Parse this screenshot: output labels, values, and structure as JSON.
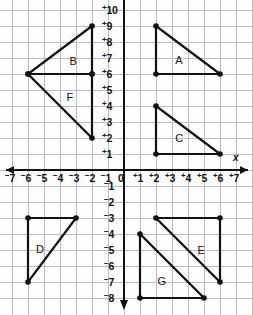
{
  "figure": {
    "type": "coordinate-plane-with-triangles",
    "background_color": "#fefefe",
    "grid_color": "#b9bcc4",
    "axis_color": "#111111",
    "shape_color": "#111111"
  },
  "axes": {
    "x_label": "x",
    "y_label": "",
    "origin_label": "0",
    "x_ticks": [
      "-7",
      "-6",
      "-5",
      "-4",
      "-3",
      "-2",
      "-1",
      "+1",
      "+2",
      "+3",
      "+4",
      "+5",
      "+6",
      "+7"
    ],
    "y_ticks_positive": [
      "+1",
      "+2",
      "+3",
      "+4",
      "+5",
      "+6",
      "+7",
      "+8",
      "+9",
      "+10"
    ],
    "y_ticks_negative": [
      "-1",
      "-2",
      "-3",
      "-4",
      "-5",
      "-6",
      "-7",
      "-8"
    ],
    "x_range": [
      -7.7,
      8.1
    ],
    "y_range": [
      -8.8,
      10.6
    ],
    "grid_step": 1,
    "tick_sign_style": "superscript"
  },
  "chart_data": {
    "type": "scatter",
    "title": "",
    "xlabel": "x",
    "ylabel": "",
    "xlim": [
      -7.7,
      8.1
    ],
    "ylim": [
      -8.8,
      10.6
    ],
    "grid": true,
    "legend": "none",
    "shapes": [
      {
        "name": "A",
        "vertices": [
          [
            2,
            9
          ],
          [
            2,
            6
          ],
          [
            6,
            6
          ]
        ],
        "label_pos": [
          3.2,
          7.2
        ]
      },
      {
        "name": "B",
        "vertices": [
          [
            -2,
            9
          ],
          [
            -6,
            6
          ],
          [
            -2,
            6
          ]
        ],
        "label_pos": [
          -3.4,
          7.1
        ]
      },
      {
        "name": "C",
        "vertices": [
          [
            2,
            4
          ],
          [
            2,
            1
          ],
          [
            6,
            1
          ]
        ],
        "label_pos": [
          3.2,
          2.3
        ]
      },
      {
        "name": "D",
        "vertices": [
          [
            -6,
            -3
          ],
          [
            -3,
            -3
          ],
          [
            -6,
            -7
          ]
        ],
        "label_pos": [
          -5.5,
          -4.6
        ]
      },
      {
        "name": "E",
        "vertices": [
          [
            2,
            -3
          ],
          [
            6,
            -3
          ],
          [
            6,
            -7
          ]
        ],
        "label_pos": [
          4.6,
          -4.7
        ]
      },
      {
        "name": "F",
        "vertices": [
          [
            -6,
            6
          ],
          [
            -2,
            6
          ],
          [
            -2,
            2
          ]
        ],
        "label_pos": [
          -3.6,
          4.9
        ]
      },
      {
        "name": "G",
        "vertices": [
          [
            1,
            -4
          ],
          [
            1,
            -8
          ],
          [
            5,
            -8
          ]
        ],
        "label_pos": [
          2.1,
          -6.6
        ]
      }
    ]
  }
}
